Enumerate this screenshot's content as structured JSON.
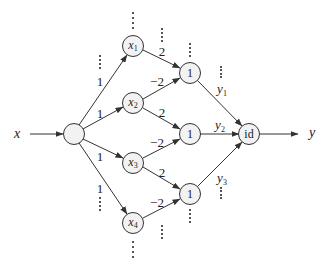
{
  "diagram": {
    "type": "neural-network",
    "input": {
      "label": "x"
    },
    "output": {
      "label": "y"
    },
    "input_node": {
      "label": ""
    },
    "layer1": [
      {
        "name": "x",
        "sub": "1",
        "weight_in": "1"
      },
      {
        "name": "x",
        "sub": "2",
        "weight_in": "1"
      },
      {
        "name": "x",
        "sub": "3",
        "weight_in": "1"
      },
      {
        "name": "x",
        "sub": "4",
        "weight_in": "1"
      }
    ],
    "layer2": [
      {
        "label": "1",
        "out": "y",
        "out_sub": "1"
      },
      {
        "label": "1",
        "out": "y",
        "out_sub": "2"
      },
      {
        "label": "1",
        "out": "y",
        "out_sub": "3"
      }
    ],
    "edge_weights": {
      "x1_h1": "2",
      "x2_h1": "−2",
      "x2_h2": "2",
      "x3_h2": "−2",
      "x3_h3": "2",
      "x4_h3": "−2"
    },
    "output_node": {
      "label": "id"
    },
    "colors": {
      "stroke": "#333333",
      "node_fill": "#f2f2f2",
      "background": "#ffffff"
    }
  }
}
